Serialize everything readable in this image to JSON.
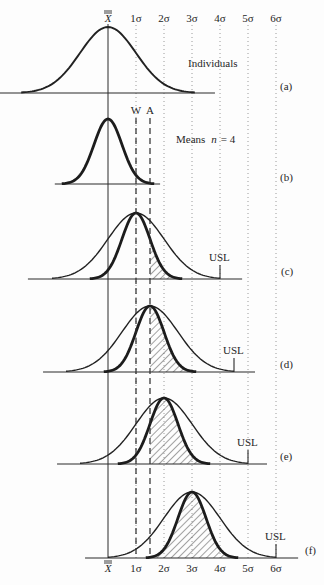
{
  "figure": {
    "mean_symbol": "X",
    "mean_symbol_bars": 2,
    "sigma_labels": [
      "1σ",
      "2σ",
      "3σ",
      "4σ",
      "5σ",
      "6σ"
    ],
    "limit_labels": {
      "warning": "W",
      "action": "A"
    },
    "usl_label": "USL",
    "panels": [
      {
        "tag": "(a)",
        "label": "Individuals"
      },
      {
        "tag": "(b)",
        "label_prefix": "Means",
        "label_var": "n",
        "label_suffix": "= 4"
      },
      {
        "tag": "(c)"
      },
      {
        "tag": "(d)"
      },
      {
        "tag": "(e)"
      },
      {
        "tag": "(f)"
      }
    ]
  },
  "chart_data": {
    "type": "diagram",
    "x_axis": {
      "unit": "σ (individuals)",
      "ticks": [
        "X̿",
        "1σ",
        "2σ",
        "3σ",
        "4σ",
        "5σ",
        "6σ"
      ],
      "tick_values": [
        0,
        1,
        2,
        3,
        4,
        5,
        6
      ]
    },
    "scale": {
      "origin_x": 108,
      "px_per_sigma": 28,
      "top_label_y": 22,
      "bottom_label_y": 572,
      "lines_top": 25,
      "lines_bottom": 558,
      "limits_top": 118
    },
    "warning_limit_sigma": 1.0,
    "action_limit_sigma": 1.5,
    "panels": [
      {
        "id": "a",
        "baseline_y": 93,
        "peak_px": 66,
        "axis": [
          -3.86,
          3.82
        ],
        "curves": [
          {
            "kind": "individuals",
            "mean": 0,
            "sd": 1,
            "style": "medium",
            "k": 3.1
          }
        ],
        "hatch": null,
        "usl": null,
        "label_pos": [
          188,
          67
        ],
        "tag_pos": [
          280,
          90
        ]
      },
      {
        "id": "b",
        "baseline_y": 184,
        "peak_px": 65,
        "axis": [
          -1.9,
          1.86
        ],
        "curves": [
          {
            "kind": "means_n4",
            "mean": 0,
            "sd": 0.5,
            "style": "thick",
            "k": 3.3
          }
        ],
        "hatch": null,
        "usl": null,
        "label_pos": [
          176,
          143
        ],
        "tag_pos": [
          280,
          181
        ]
      },
      {
        "id": "c",
        "baseline_y": 279,
        "peak_px": 66,
        "axis": [
          -2.86,
          4.79
        ],
        "curves": [
          {
            "kind": "individuals",
            "mean": 1,
            "sd": 1,
            "style": "wide",
            "k": 3
          },
          {
            "kind": "means_n4",
            "mean": 1,
            "sd": 0.5,
            "style": "thick",
            "k": 3.3
          }
        ],
        "hatch": {
          "from_sigma": 1.5
        },
        "usl": 4,
        "tag_pos": [
          281,
          275
        ]
      },
      {
        "id": "d",
        "baseline_y": 372,
        "peak_px": 66,
        "axis": [
          -2.32,
          5.25
        ],
        "curves": [
          {
            "kind": "individuals",
            "mean": 1.5,
            "sd": 1,
            "style": "wide",
            "k": 3
          },
          {
            "kind": "means_n4",
            "mean": 1.5,
            "sd": 0.5,
            "style": "thick",
            "k": 3.3
          }
        ],
        "hatch": {
          "from_sigma": 1.5
        },
        "usl": 4.5,
        "tag_pos": [
          280,
          368
        ]
      },
      {
        "id": "e",
        "baseline_y": 464,
        "peak_px": 66,
        "axis": [
          -1.82,
          5.68
        ],
        "curves": [
          {
            "kind": "individuals",
            "mean": 2,
            "sd": 1,
            "style": "wide",
            "k": 3
          },
          {
            "kind": "means_n4",
            "mean": 2,
            "sd": 0.5,
            "style": "thick",
            "k": 3.3
          }
        ],
        "hatch": {
          "from_sigma": 1.5
        },
        "usl": 5,
        "tag_pos": [
          280,
          460
        ]
      },
      {
        "id": "f",
        "baseline_y": 558,
        "peak_px": 66,
        "axis": [
          -0.82,
          6.79
        ],
        "curves": [
          {
            "kind": "individuals",
            "mean": 3,
            "sd": 1,
            "style": "wide",
            "k": 3
          },
          {
            "kind": "means_n4",
            "mean": 3,
            "sd": 0.5,
            "style": "thick",
            "k": 3.3
          }
        ],
        "hatch": {
          "from_sigma": 1.5
        },
        "usl": 6,
        "tag_pos": [
          305,
          554
        ]
      }
    ]
  }
}
